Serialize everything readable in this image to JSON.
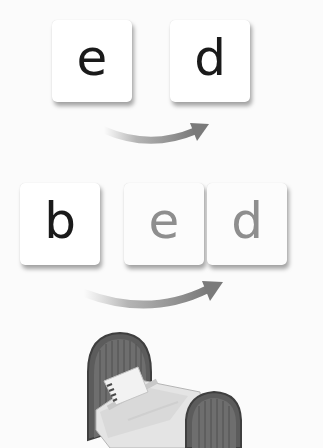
{
  "row1": {
    "tiles": [
      {
        "letter": "e",
        "style": "dark"
      },
      {
        "letter": "d",
        "style": "dark"
      }
    ],
    "arrow": "curved-arrow-right"
  },
  "row2": {
    "tiles": [
      {
        "letter": "b",
        "style": "dark"
      },
      {
        "letter": "e",
        "style": "light"
      },
      {
        "letter": "d",
        "style": "light"
      }
    ],
    "arrow": "curved-arrow-right"
  },
  "result": {
    "word": "bed",
    "image": "bed-illustration"
  },
  "colors": {
    "background": "#fbfbfb",
    "tile": "#ffffff",
    "letter_dark": "#1a1a1a",
    "letter_light": "#8e8e8e",
    "arrow": "#7a7a7a",
    "bed_frame": "#5a5a5a"
  }
}
